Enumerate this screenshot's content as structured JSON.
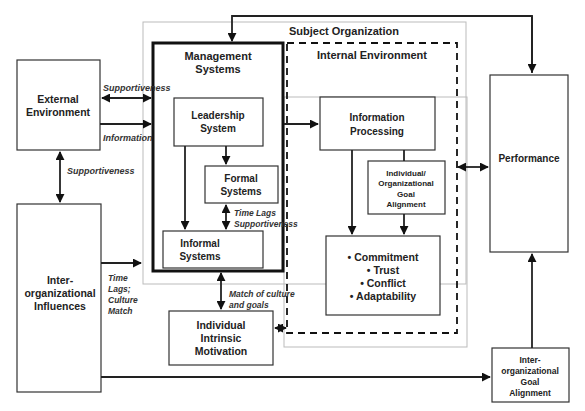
{
  "diagram": {
    "containers": {
      "subject_organization": "Subject Organization",
      "management_systems": [
        "Management",
        "Systems"
      ],
      "internal_environment": "Internal Environment"
    },
    "nodes": {
      "external_environment": [
        "External",
        "Environment"
      ],
      "inter_org_influences": [
        "Inter-",
        "organizational",
        "Influences"
      ],
      "leadership_system": [
        "Leadership",
        "System"
      ],
      "formal_systems": [
        "Formal",
        "Systems"
      ],
      "informal_systems": [
        "Informal",
        "Systems"
      ],
      "information_processing": [
        "Information",
        "Processing"
      ],
      "goal_alignment": [
        "Individual/",
        "Organizational",
        "Goal",
        "Alignment"
      ],
      "outcomes": [
        "• Commitment",
        "• Trust",
        "• Conflict",
        "• Adaptability"
      ],
      "performance": "Performance",
      "intrinsic_motivation": [
        "Individual",
        "Intrinsic",
        "Motivation"
      ],
      "inter_org_goal_alignment": [
        "Inter-",
        "organizational",
        "Goal",
        "Alignment"
      ]
    },
    "edge_labels": {
      "supportiveness_top": "Supportiveness",
      "information": "Information",
      "supportiveness_left": "Supportiveness",
      "time_lags_supportiveness": [
        "Time Lags",
        "Supportiveness"
      ],
      "time_lags_culture": [
        "Time",
        "Lags;",
        "Culture",
        "Match"
      ],
      "match_culture_goals": [
        "Match of culture",
        "and goals"
      ]
    }
  }
}
